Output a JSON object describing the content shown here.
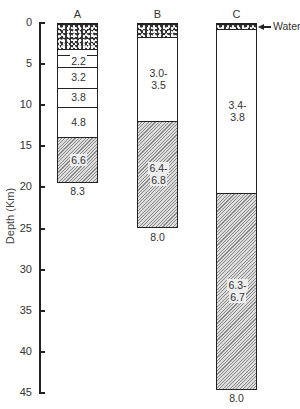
{
  "axis": {
    "label": "Depth (Km)",
    "ticks": [
      "0",
      "5",
      "10",
      "15",
      "20",
      "25",
      "30",
      "35",
      "40",
      "45"
    ],
    "px_per_km": 8.22,
    "origin_y": 23
  },
  "columns": [
    {
      "label": "A",
      "bottom_value": "8.3",
      "layers": [
        {
          "type": "sediment",
          "top_km": 0,
          "bottom_km": 3.3,
          "value": ""
        },
        {
          "type": "blank",
          "top_km": 3.3,
          "bottom_km": 4.0,
          "value": ""
        },
        {
          "type": "blank",
          "top_km": 4.0,
          "bottom_km": 5.5,
          "value": "2.2"
        },
        {
          "type": "blank",
          "top_km": 5.5,
          "bottom_km": 8.0,
          "value": "3.2"
        },
        {
          "type": "blank",
          "top_km": 8.0,
          "bottom_km": 10.3,
          "value": "3.8"
        },
        {
          "type": "blank",
          "top_km": 10.3,
          "bottom_km": 14.0,
          "value": "4.8"
        },
        {
          "type": "hatch",
          "top_km": 14.0,
          "bottom_km": 19.5,
          "value": "6.6"
        }
      ]
    },
    {
      "label": "B",
      "bottom_value": "8.0",
      "layers": [
        {
          "type": "sediment",
          "top_km": 0,
          "bottom_km": 1.8,
          "value": ""
        },
        {
          "type": "blank",
          "top_km": 1.8,
          "bottom_km": 12.0,
          "value": "3.0-\n3.5"
        },
        {
          "type": "hatch",
          "top_km": 12.0,
          "bottom_km": 25.0,
          "value": "6.4-\n6.8"
        }
      ]
    },
    {
      "label": "C",
      "bottom_value": "8.0",
      "annotation": "Water",
      "layers": [
        {
          "type": "sediment",
          "top_km": 0,
          "bottom_km": 0.9,
          "value": ""
        },
        {
          "type": "blank",
          "top_km": 0.9,
          "bottom_km": 20.8,
          "value": "3.4-\n3.8"
        },
        {
          "type": "hatch",
          "top_km": 20.8,
          "bottom_km": 44.6,
          "value": "6.3-\n6.7"
        }
      ]
    }
  ]
}
